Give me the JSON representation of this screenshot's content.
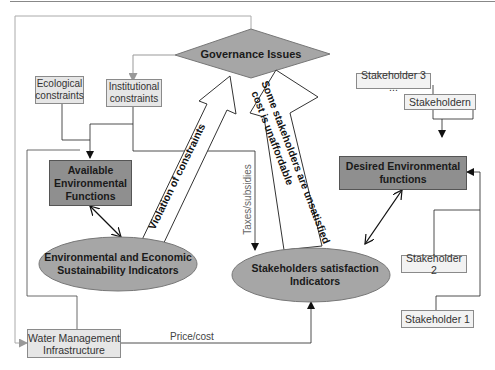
{
  "diagram": {
    "nodes": {
      "governance": {
        "label": "Governance Issues",
        "shape": "diamond",
        "fill": "#a6a6a6"
      },
      "ecological": {
        "label": "Ecological constraints",
        "line1": "Ecological",
        "line2": "constraints",
        "shape": "rect",
        "fill": "#e6e6e6"
      },
      "institutional": {
        "label": "Institutional constraints",
        "line1": "Institutional",
        "line2": "constraints",
        "shape": "rect",
        "fill": "#e6e6e6"
      },
      "available_env": {
        "line1": "Available",
        "line2": "Environmental",
        "line3": "Functions",
        "shape": "rect",
        "fill": "#8f8f8f"
      },
      "env_econ": {
        "line1": "Environmental and Economic",
        "line2": "Sustainability Indicators",
        "shape": "ellipse",
        "fill": "#a6a6a6"
      },
      "stakeholders_sat": {
        "line1": "Stakeholders satisfaction",
        "line2": "Indicators",
        "shape": "ellipse",
        "fill": "#a6a6a6"
      },
      "desired_env": {
        "line1": "Desired Environmental",
        "line2": "functions",
        "shape": "rect",
        "fill": "#8f8f8f"
      },
      "water_mgmt": {
        "line1": "Water Management",
        "line2": "Infrastructure",
        "shape": "rect",
        "fill": "#e6e6e6"
      },
      "stakeholder_3": {
        "label": "Stakeholder 3 ...",
        "shape": "rect",
        "fill": "#f2f2f2"
      },
      "stakeholder_n": {
        "label": "Stakeholdern",
        "shape": "rect",
        "fill": "#f2f2f2"
      },
      "stakeholder_2": {
        "label": "Stakeholder 2",
        "shape": "rect",
        "fill": "#f2f2f2"
      },
      "stakeholder_1": {
        "label": "Stakeholder 1",
        "shape": "rect",
        "fill": "#f2f2f2"
      }
    },
    "block_arrows": {
      "violation": {
        "label": "Violation of constraints"
      },
      "unsatisfied": {
        "line1": "Some stakeholders are unsatisfied",
        "line2": "cost is unaffordable"
      }
    },
    "edge_labels": {
      "taxes": "Taxes/subsidies",
      "price": "Price/cost"
    }
  }
}
